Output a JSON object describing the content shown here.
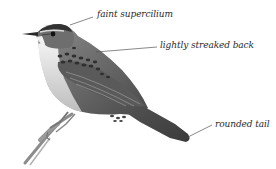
{
  "figure": {
    "palette": {
      "background": "#ffffff",
      "ink": "#2a2a2a",
      "leader_line": "#555555",
      "plumage_dark": "#3a3a3a",
      "plumage_mid": "#7a7a7a",
      "plumage_light": "#c8c8c8",
      "underparts": "#e6e6e6"
    },
    "annotations": [
      {
        "label": "faint supercilium"
      },
      {
        "label": "lightly streaked back"
      },
      {
        "label": "rounded tail"
      }
    ]
  }
}
